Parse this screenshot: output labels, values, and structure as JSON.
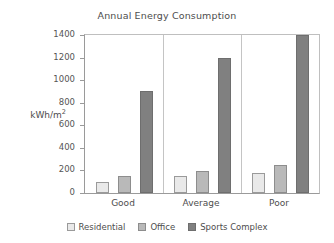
{
  "chart_data": {
    "type": "bar",
    "title": "Annual Energy Consumption",
    "xlabel": "",
    "ylabel": "kWh/m²",
    "ylabel_base": "kWh/m",
    "ylabel_sup": "2",
    "categories": [
      "Good",
      "Average",
      "Poor"
    ],
    "series": [
      {
        "name": "Residential",
        "values": [
          100,
          150,
          180
        ],
        "color": "#e9e9e9",
        "border": "#9a9a9a"
      },
      {
        "name": "Office",
        "values": [
          150,
          195,
          250
        ],
        "color": "#b9b9b9",
        "border": "#8d8d8d"
      },
      {
        "name": "Sports Complex",
        "values": [
          900,
          1200,
          1400
        ],
        "color": "#808080",
        "border": "#6e6e6e"
      }
    ],
    "ylim": [
      0,
      1400
    ],
    "ytick_values": [
      0,
      200,
      400,
      600,
      800,
      1000,
      1200,
      1400
    ],
    "ytick_labels": [
      "0",
      "200",
      "400",
      "600",
      "800",
      "1000",
      "1200",
      "1400"
    ],
    "grid": false,
    "group_separators": true,
    "legend_position": "bottom",
    "legend_entries": [
      "Residential",
      "Office",
      "Sports Complex"
    ],
    "axis_color": "#9a9a9a",
    "text_color": "#4d4d4d",
    "background": "#ffffff"
  }
}
